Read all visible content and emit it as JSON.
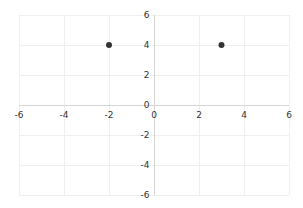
{
  "chart_data": {
    "type": "scatter",
    "title": "",
    "xlabel": "",
    "ylabel": "",
    "xlim": [
      -6,
      6
    ],
    "ylim": [
      -6,
      6
    ],
    "grid": true,
    "legend": null,
    "x_ticks": [
      "-6",
      "-4",
      "-2",
      "0",
      "2",
      "4",
      "6"
    ],
    "y_ticks": [
      "6",
      "4",
      "2",
      "0",
      "-2",
      "-4",
      "-6"
    ],
    "series": [
      {
        "name": "points",
        "color": "#333333",
        "points": [
          {
            "x": -2,
            "y": 4
          },
          {
            "x": 3,
            "y": 4
          }
        ]
      }
    ]
  },
  "layout": {
    "plot_left": 19,
    "plot_right": 289,
    "plot_top": 15,
    "plot_bottom": 195,
    "colors": {
      "grid": "#efefef",
      "axis": "#d6d6d6",
      "label": "#333333",
      "point": "#333333"
    }
  }
}
